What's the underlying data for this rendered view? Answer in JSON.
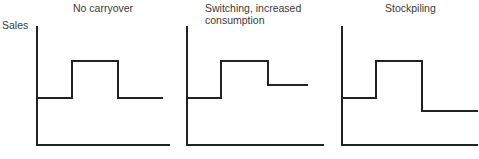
{
  "chart_data": {
    "type": "line",
    "ylabel": "Sales",
    "panels": [
      {
        "title": "No carryover",
        "levels": {
          "baseline": "low",
          "promo": "high",
          "after": "same as baseline"
        },
        "path": [
          [
            37,
            98
          ],
          [
            72,
            98
          ],
          [
            72,
            61
          ],
          [
            118,
            61
          ],
          [
            118,
            98
          ],
          [
            163,
            98
          ]
        ],
        "axis": {
          "x0": 37,
          "x1": 170,
          "ytop": 26,
          "ybottom": 145
        }
      },
      {
        "title": "Switching, increased consumption",
        "levels": {
          "baseline": "low",
          "promo": "high",
          "after": "above baseline"
        },
        "path": [
          [
            187,
            98
          ],
          [
            221,
            98
          ],
          [
            221,
            61
          ],
          [
            268,
            61
          ],
          [
            268,
            85
          ],
          [
            308,
            85
          ]
        ],
        "axis": {
          "x0": 187,
          "x1": 324,
          "ytop": 26,
          "ybottom": 145
        }
      },
      {
        "title": "Stockpiling",
        "levels": {
          "baseline": "low",
          "promo": "high",
          "after": "below baseline"
        },
        "path": [
          [
            342,
            98
          ],
          [
            376,
            98
          ],
          [
            376,
            61
          ],
          [
            422,
            61
          ],
          [
            422,
            111
          ],
          [
            478,
            111
          ]
        ],
        "axis": {
          "x0": 342,
          "x1": 478,
          "ytop": 26,
          "ybottom": 145
        }
      }
    ]
  },
  "labels": {
    "ylabel": "Sales",
    "titles": [
      "No carryover",
      "Switching, increased",
      "consumption",
      "Stockpiling"
    ]
  }
}
